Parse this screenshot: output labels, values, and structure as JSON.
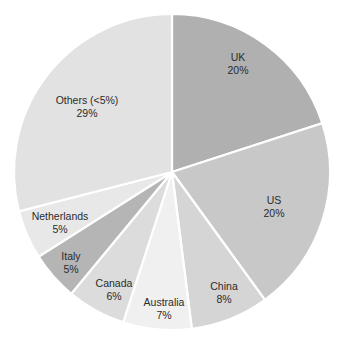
{
  "chart_data": {
    "type": "pie",
    "title": "",
    "subtitle": "",
    "xlabel": "",
    "ylabel": "",
    "legend_position": "none",
    "grid": false,
    "labels_inside_slices": true,
    "start_angle_deg": 0,
    "direction": "clockwise",
    "categories": [
      "UK",
      "US",
      "China",
      "Australia",
      "Canada",
      "Italy",
      "Netherlands",
      "Others (<5%)"
    ],
    "values": [
      20,
      20,
      8,
      7,
      6,
      5,
      5,
      29
    ],
    "value_labels": [
      "20%",
      "20%",
      "8%",
      "7%",
      "6%",
      "5%",
      "5%",
      "29%"
    ],
    "units": "percent",
    "total": 100,
    "slices": [
      {
        "name": "UK",
        "value": 20,
        "value_label": "20%",
        "color": "#b0b0b0",
        "label_x": 238,
        "label_y": 64
      },
      {
        "name": "US",
        "value": 20,
        "value_label": "20%",
        "color": "#c8c8c8",
        "label_x": 274,
        "label_y": 207
      },
      {
        "name": "China",
        "value": 8,
        "value_label": "8%",
        "color": "#d5d5d5",
        "label_x": 224,
        "label_y": 293
      },
      {
        "name": "Australia",
        "value": 7,
        "value_label": "7%",
        "color": "#f0f0f0",
        "label_x": 164,
        "label_y": 309
      },
      {
        "name": "Canada",
        "value": 6,
        "value_label": "6%",
        "color": "#dcdcdc",
        "label_x": 114,
        "label_y": 290
      },
      {
        "name": "Italy",
        "value": 5,
        "value_label": "5%",
        "color": "#b5b5b5",
        "label_x": 71,
        "label_y": 263
      },
      {
        "name": "Netherlands",
        "value": 5,
        "value_label": "5%",
        "color": "#e8e8e8",
        "label_x": 60,
        "label_y": 223
      },
      {
        "name": "Others (<5%)",
        "value": 29,
        "value_label": "29%",
        "color": "#e2e2e2",
        "label_x": 87,
        "label_y": 107
      }
    ],
    "geometry": {
      "center_x": 172,
      "center_y": 172,
      "radius": 158
    },
    "colors": {
      "separator": "#ffffff",
      "background": "#ffffff",
      "label_text": "#2b2b2b"
    }
  }
}
